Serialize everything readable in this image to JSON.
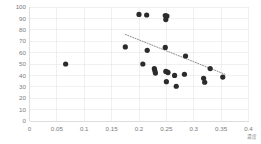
{
  "chart_data": {
    "type": "scatter",
    "title": "",
    "xlabel": "濃度",
    "ylabel": "",
    "xlim": [
      0,
      0.4
    ],
    "ylim": [
      0,
      100
    ],
    "xticks": [
      0,
      0.05,
      0.1,
      0.15,
      0.2,
      0.25,
      0.3,
      0.35,
      0.4
    ],
    "xticklabels": [
      "0",
      "0.05",
      "0.1",
      "0.15",
      "0.2",
      "0.25",
      "0.3",
      "0.35",
      "0.4"
    ],
    "yticks": [
      0,
      10,
      20,
      30,
      40,
      50,
      60,
      70,
      80,
      90,
      100
    ],
    "yticklabels": [
      "0",
      "10",
      "20",
      "30",
      "40",
      "50",
      "60",
      "70",
      "80",
      "90",
      "100"
    ],
    "grid": true,
    "grid_color": "#e2e2e2",
    "point_color": "#2b2b2b",
    "point_size": 2.6,
    "legend": false,
    "series": [
      {
        "name": "data",
        "points": [
          [
            0.066,
            50
          ],
          [
            0.175,
            65
          ],
          [
            0.2,
            93.5
          ],
          [
            0.207,
            50
          ],
          [
            0.214,
            93
          ],
          [
            0.215,
            62
          ],
          [
            0.228,
            46
          ],
          [
            0.229,
            44
          ],
          [
            0.23,
            42
          ],
          [
            0.248,
            92.5
          ],
          [
            0.249,
            89
          ],
          [
            0.249,
            43.5
          ],
          [
            0.251,
            92
          ],
          [
            0.252,
            43
          ],
          [
            0.253,
            42.5
          ],
          [
            0.25,
            34.5
          ],
          [
            0.248,
            64.5
          ],
          [
            0.265,
            40
          ],
          [
            0.268,
            30.5
          ],
          [
            0.283,
            41
          ],
          [
            0.285,
            57
          ],
          [
            0.318,
            37.5
          ],
          [
            0.32,
            34
          ],
          [
            0.33,
            46
          ],
          [
            0.353,
            38.5
          ]
        ]
      }
    ],
    "trendline": {
      "visible": true,
      "style": "dotted",
      "color": "#7a7a7a",
      "x_start": 0.175,
      "y_start": 76,
      "x_end": 0.357,
      "y_end": 41
    }
  }
}
